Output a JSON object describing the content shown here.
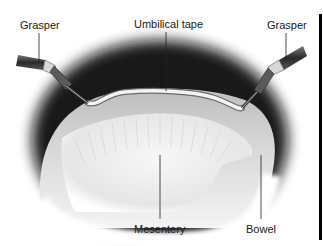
{
  "figure": {
    "type": "surgical illustration",
    "labels": {
      "grasper_left": "Grasper",
      "umbilical_tape": "Umbilical tape",
      "grasper_right": "Grasper",
      "mesentery": "Mesentery",
      "bowel": "Bowel"
    },
    "colors": {
      "background": "#ffffff",
      "shadow": "#111111",
      "bowel": "#c9c9c9",
      "mesentery": "#ececec",
      "tape": "#f2f2f2",
      "instrument": "#3a3a3a",
      "text": "#1a1a1a"
    }
  }
}
